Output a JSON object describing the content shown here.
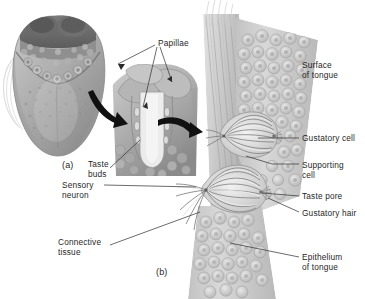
{
  "figure": {
    "background_color": "#ffffff",
    "text_color": "#1f1f1f",
    "leader_line_color": "#3a3a3a",
    "arrow_color": "#111111",
    "illustration_tone": "grayscale"
  },
  "panel_labels": [
    {
      "id": "a",
      "text": "(a)",
      "x": 62,
      "y": 160
    },
    {
      "id": "b",
      "text": "(b)",
      "x": 156,
      "y": 267
    }
  ],
  "labels": [
    {
      "id": "papillae",
      "text": "Papillae",
      "x": 158,
      "y": 39,
      "align": "left",
      "desc": "three arrows to papillae on tongue surface and cross-section"
    },
    {
      "id": "taste-buds",
      "text": "Taste\nbuds",
      "x": 88,
      "y": 160,
      "align": "left",
      "desc": "points into papilla cross-section"
    },
    {
      "id": "sensory-neuron",
      "text": "Sensory\nneuron",
      "x": 62,
      "y": 181,
      "align": "left",
      "desc": "leader to nerve fibers under lower taste bud"
    },
    {
      "id": "connective-tissue",
      "text": "Connective\ntissue",
      "x": 58,
      "y": 238,
      "align": "left",
      "desc": "leader to connective tissue band"
    },
    {
      "id": "surface-of-tongue",
      "text": "Surface\nof tongue",
      "x": 302,
      "y": 61,
      "align": "left",
      "desc": "upper right, epithelial surface"
    },
    {
      "id": "gustatory-cell",
      "text": "Gustatory cell",
      "x": 302,
      "y": 134,
      "align": "left",
      "desc": "leader to upper taste bud cells"
    },
    {
      "id": "supporting-cell",
      "text": "Supporting\ncell",
      "x": 302,
      "y": 161,
      "align": "left",
      "desc": "leader to supporting cells"
    },
    {
      "id": "taste-pore",
      "text": "Taste pore",
      "x": 302,
      "y": 192,
      "align": "left",
      "desc": "leader to pore of lower taste bud"
    },
    {
      "id": "gustatory-hair",
      "text": "Gustatory hair",
      "x": 302,
      "y": 209,
      "align": "left",
      "desc": "leader to microvilli at taste pore"
    },
    {
      "id": "epithelium-of-tongue",
      "text": "Epithelium\nof tongue",
      "x": 302,
      "y": 253,
      "align": "left",
      "desc": "leader to stratified epithelium"
    }
  ],
  "illustrations": [
    {
      "id": "tongue-dorsum",
      "panel": "a",
      "desc": "superior view of tongue showing papillae"
    },
    {
      "id": "papilla-section",
      "panel": "a",
      "desc": "cut-away of circumvallate papilla"
    },
    {
      "id": "taste-bud-section",
      "panel": "b",
      "desc": "epithelium band with two taste buds"
    }
  ]
}
